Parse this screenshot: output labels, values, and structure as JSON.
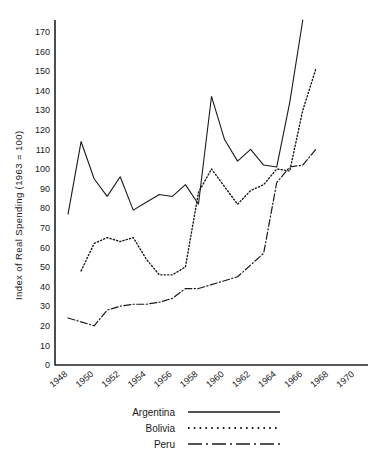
{
  "chart_data": {
    "type": "line",
    "title": "",
    "xlabel": "",
    "ylabel": "Index of Real Spending (1963 = 100)",
    "xlim": [
      1947,
      1971
    ],
    "ylim": [
      0,
      176
    ],
    "grid": false,
    "legend_position": "below-center",
    "y_ticks": [
      0,
      10,
      20,
      30,
      40,
      50,
      60,
      70,
      80,
      90,
      100,
      110,
      120,
      130,
      140,
      150,
      160,
      170
    ],
    "y_tick_labels": [
      "0",
      "10",
      "20",
      "30",
      "40",
      "50",
      "60",
      "70",
      "80",
      "90",
      "100",
      "110",
      "120",
      "130",
      "140",
      "150",
      "160",
      "170"
    ],
    "x_ticks": [
      1948,
      1950,
      1952,
      1954,
      1956,
      1958,
      1960,
      1962,
      1964,
      1966,
      1968,
      1970
    ],
    "x_tick_labels": [
      "1948",
      "1950",
      "1952",
      "1954",
      "1956",
      "1958",
      "1960",
      "1962",
      "1964",
      "1966",
      "1968",
      "1970"
    ],
    "series": [
      {
        "name": "Argentina",
        "style": "solid",
        "x": [
          1948,
          1949,
          1950,
          1951,
          1952,
          1953,
          1954,
          1955,
          1956,
          1957,
          1958,
          1959,
          1960,
          1961,
          1962,
          1963,
          1964,
          1965,
          1966
        ],
        "values": [
          77,
          114,
          95,
          86,
          96,
          79,
          83,
          87,
          86,
          92,
          82,
          137,
          115,
          104,
          110,
          102,
          101,
          134,
          176
        ]
      },
      {
        "name": "Bolivia",
        "style": "dotted",
        "x": [
          1949,
          1950,
          1951,
          1952,
          1953,
          1954,
          1955,
          1956,
          1957,
          1958,
          1959,
          1960,
          1961,
          1962,
          1963,
          1964,
          1965,
          1966,
          1967
        ],
        "values": [
          48,
          62,
          65,
          63,
          65,
          54,
          46,
          46,
          50,
          88,
          100,
          91,
          82,
          89,
          92,
          100,
          99,
          130,
          151
        ]
      },
      {
        "name": "Peru",
        "style": "dash-dot",
        "x": [
          1948,
          1949,
          1950,
          1951,
          1952,
          1953,
          1954,
          1955,
          1956,
          1957,
          1958,
          1959,
          1960,
          1961,
          1962,
          1963,
          1964,
          1965,
          1966,
          1967
        ],
        "values": [
          24,
          22,
          20,
          28,
          30,
          31,
          31,
          32,
          34,
          39,
          39,
          41,
          43,
          45,
          51,
          57,
          93,
          101,
          102,
          110
        ]
      }
    ]
  },
  "legend": {
    "entries": [
      {
        "label": "Argentina",
        "style": "solid"
      },
      {
        "label": "Bolivia",
        "style": "dotted"
      },
      {
        "label": "Peru",
        "style": "dash-dot"
      }
    ]
  },
  "colors": {
    "ink": "#1a1a1a",
    "axis": "#222222",
    "background": "#ffffff"
  }
}
